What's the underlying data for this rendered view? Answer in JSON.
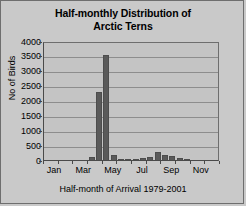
{
  "chart_data": {
    "type": "bar",
    "title": "Half-monthly Distribution of Arctic Terns",
    "title_line1": "Half-monthly Distribution of",
    "title_line2": "Arctic Terns",
    "xlabel": "Half-month of Arrival 1979-2001",
    "ylabel": "No of Birds",
    "ylim": [
      0,
      4000
    ],
    "ytick_labels": [
      "4000",
      "3500",
      "3000",
      "2500",
      "2000",
      "1500",
      "1000",
      "500",
      "0"
    ],
    "ytick_values": [
      4000,
      3500,
      3000,
      2500,
      2000,
      1500,
      1000,
      500,
      0
    ],
    "grid": true,
    "legend": "none",
    "bar_color": "#5a5a5a",
    "plot_background": "#c4c4c4",
    "figure_background": "#c9c9c9",
    "axis_color": "#4a4a4a",
    "gridline_color": "#8d8d8d",
    "xtick_labels": [
      "Jan",
      "Mar",
      "May",
      "Jul",
      "Sep",
      "Nov"
    ],
    "xtick_positions": [
      1.5,
      5.5,
      9.5,
      13.5,
      17.5,
      21.5
    ],
    "categories": [
      "Jan-1",
      "Jan-2",
      "Feb-1",
      "Feb-2",
      "Mar-1",
      "Mar-2",
      "Apr-1",
      "Apr-2",
      "May-1",
      "May-2",
      "Jun-1",
      "Jun-2",
      "Jul-1",
      "Jul-2",
      "Aug-1",
      "Aug-2",
      "Sep-1",
      "Sep-2",
      "Oct-1",
      "Oct-2",
      "Nov-1",
      "Nov-2",
      "Dec-1",
      "Dec-2"
    ],
    "values": [
      0,
      0,
      0,
      0,
      0,
      0,
      115,
      2280,
      3540,
      185,
      30,
      25,
      35,
      55,
      90,
      255,
      160,
      145,
      55,
      40,
      0,
      0,
      0,
      0
    ]
  }
}
